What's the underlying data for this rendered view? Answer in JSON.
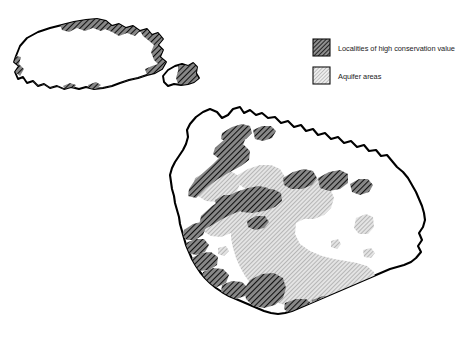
{
  "figure": {
    "background_color": "#ffffff",
    "outline_color": "#000000"
  },
  "legend": {
    "position": "top-right",
    "items": [
      {
        "id": "conservation",
        "label": "Localities of high conservation value",
        "swatch_name": "dense-diagonal-hatch-swatch",
        "pattern": "dense-diagonal-hatch",
        "fill_color": "#6e6e6e",
        "line_color": "#1c1c1c"
      },
      {
        "id": "aquifer",
        "label": "Aquifer areas",
        "swatch_name": "light-diagonal-hatch-swatch",
        "pattern": "light-diagonal-hatch",
        "fill_color": "#b9b9b9",
        "line_color": "#8a8a8a"
      }
    ]
  },
  "map": {
    "islands": [
      {
        "id": "gozo",
        "name": "Gozo"
      },
      {
        "id": "comino",
        "name": "Comino"
      },
      {
        "id": "malta",
        "name": "Malta"
      }
    ]
  }
}
